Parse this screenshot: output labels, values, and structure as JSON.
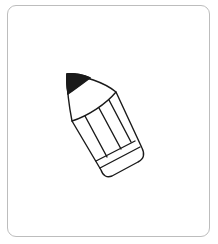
{
  "image": {
    "subject": "pencil-icon",
    "description": "Line drawing of a pencil tilted diagonally inside a rounded frame",
    "colors": {
      "background": "#ffffff",
      "frame_border": "#bdbdbd",
      "stroke": "#1a1a1a",
      "tip_fill": "#1a1a1a"
    }
  }
}
